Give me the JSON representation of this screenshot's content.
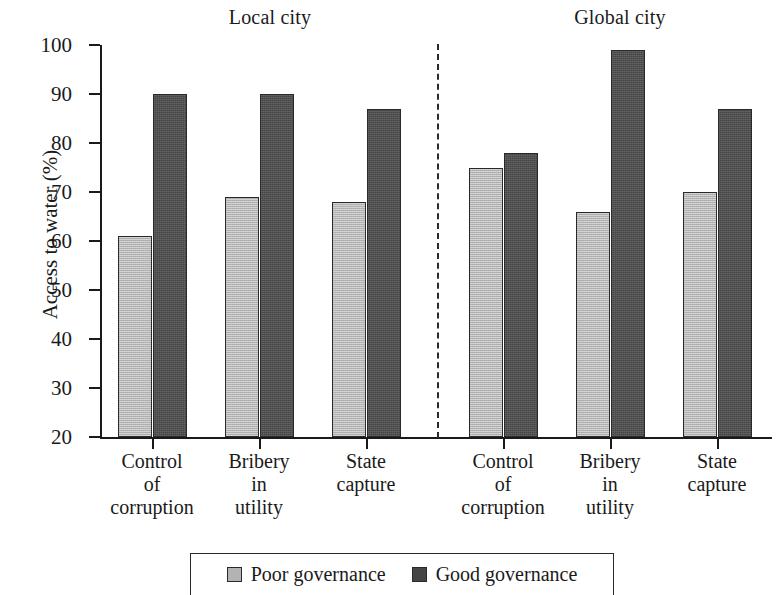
{
  "chart_data": {
    "type": "bar",
    "title": "",
    "xlabel": "",
    "ylabel": "Access to water (%)",
    "ylim": [
      20,
      100
    ],
    "ytick_step": 10,
    "yticks": [
      100,
      90,
      80,
      70,
      60,
      50,
      40,
      30,
      20
    ],
    "grid": false,
    "legend_position": "bottom",
    "panels": [
      {
        "name": "Local city",
        "categories": [
          "Control of corruption",
          "Bribery in utility",
          "State capture"
        ],
        "series": [
          {
            "name": "Poor governance",
            "values": [
              61,
              69,
              68
            ]
          },
          {
            "name": "Good governance",
            "values": [
              90,
              90,
              87
            ]
          }
        ]
      },
      {
        "name": "Global city",
        "categories": [
          "Control of corruption",
          "Bribery in utility",
          "State capture"
        ],
        "series": [
          {
            "name": "Poor governance",
            "values": [
              75,
              66,
              70
            ]
          },
          {
            "name": "Good governance",
            "values": [
              78,
              99,
              87
            ]
          }
        ]
      }
    ],
    "series_colors": {
      "Poor governance": "#b3b3b3",
      "Good governance": "#454545"
    },
    "annotations": [
      "dashed vertical divider between Local city and Global city panels"
    ]
  },
  "titles": {
    "local": "Local city",
    "global": "Global city"
  },
  "axis": {
    "y_label": "Access to water (%)",
    "ytick_labels": [
      "100",
      "90",
      "80",
      "70",
      "60",
      "50",
      "40",
      "30",
      "20"
    ]
  },
  "xlabels": [
    {
      "l1": "Control",
      "l2": "of",
      "l3": "corruption"
    },
    {
      "l1": "Bribery",
      "l2": "in",
      "l3": "utility"
    },
    {
      "l1": "State",
      "l2": "capture",
      "l3": ""
    },
    {
      "l1": "Control",
      "l2": "of",
      "l3": "corruption"
    },
    {
      "l1": "Bribery",
      "l2": "in",
      "l3": "utility"
    },
    {
      "l1": "State",
      "l2": "capture",
      "l3": ""
    }
  ],
  "legend": {
    "items": [
      {
        "label": "Poor governance",
        "color": "#b3b3b3"
      },
      {
        "label": "Good governance",
        "color": "#454545"
      }
    ]
  }
}
